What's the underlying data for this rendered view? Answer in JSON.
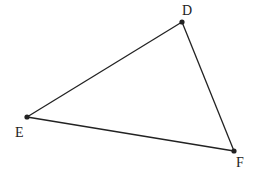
{
  "diagram": {
    "type": "triangle",
    "stroke_color": "#222222",
    "points": [
      {
        "label": "D",
        "x": 182,
        "y": 22,
        "label_x": 182,
        "label_y": 15
      },
      {
        "label": "E",
        "x": 27,
        "y": 117,
        "label_x": 15,
        "label_y": 137
      },
      {
        "label": "F",
        "x": 234,
        "y": 151,
        "label_x": 236,
        "label_y": 167
      }
    ],
    "segments": [
      [
        "D",
        "E"
      ],
      [
        "E",
        "F"
      ],
      [
        "F",
        "D"
      ]
    ]
  }
}
